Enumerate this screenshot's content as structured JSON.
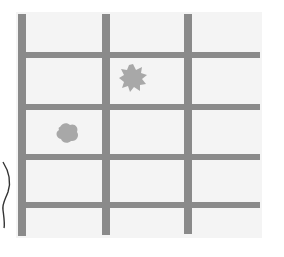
{
  "diagram": {
    "type": "grid",
    "colors": {
      "background": "#ffffff",
      "panel": "#f4f4f4",
      "grid_line": "#8a8a8a",
      "blob": "#a8a8a8",
      "squiggle": "#333333"
    },
    "panel": {
      "x": 16,
      "y": 12,
      "w": 246,
      "h": 226
    },
    "vertical_lines": [
      {
        "x": 18,
        "y1": 14,
        "y2": 236,
        "w": 8
      },
      {
        "x": 102,
        "y1": 14,
        "y2": 235,
        "w": 8
      },
      {
        "x": 184,
        "y1": 14,
        "y2": 234,
        "w": 8
      }
    ],
    "horizontal_lines": [
      {
        "y": 52,
        "x1": 18,
        "x2": 260,
        "h": 6
      },
      {
        "y": 104,
        "x1": 18,
        "x2": 260,
        "h": 6
      },
      {
        "y": 154,
        "x1": 18,
        "x2": 260,
        "h": 6
      },
      {
        "y": 202,
        "x1": 18,
        "x2": 260,
        "h": 6
      }
    ],
    "blobs": [
      {
        "id": "blob-1",
        "cx": 133,
        "cy": 78,
        "r": 13,
        "shape": "spiky"
      },
      {
        "id": "blob-2",
        "cx": 67,
        "cy": 133,
        "r": 11,
        "shape": "rounded"
      }
    ],
    "squiggle": {
      "x": 0,
      "y": 160,
      "w": 14,
      "h": 70
    }
  }
}
